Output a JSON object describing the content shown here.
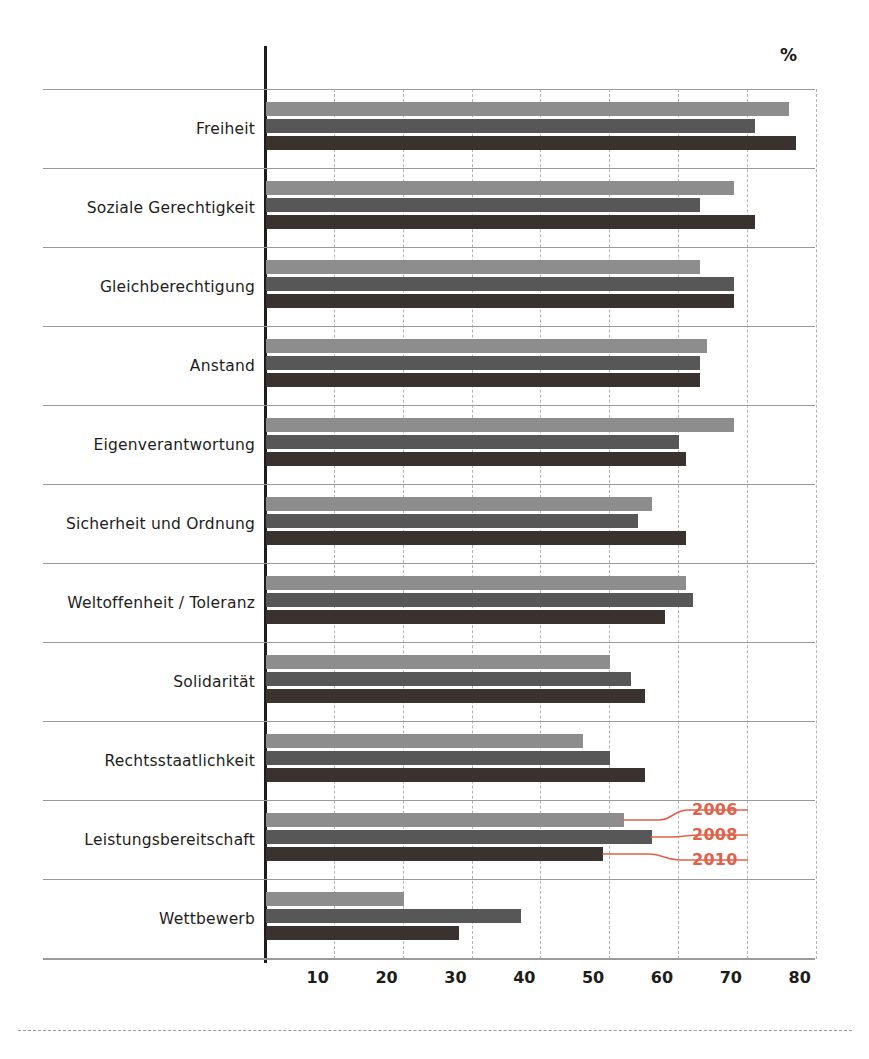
{
  "chart_data": {
    "type": "bar",
    "orientation": "horizontal",
    "title": "",
    "subtitle": "",
    "xlabel": "",
    "ylabel": "",
    "unit_label": "%",
    "xlim": [
      0,
      85
    ],
    "xticks": [
      10,
      20,
      30,
      40,
      50,
      60,
      70,
      80
    ],
    "xtick_labels": [
      "10",
      "20",
      "30",
      "40",
      "50",
      "60",
      "70",
      "80"
    ],
    "grid": "vertical-dashed",
    "legend_position": "inline-callout",
    "categories": [
      "Freiheit",
      "Soziale Gerechtigkeit",
      "Gleichberechtigung",
      "Anstand",
      "Eigenverantwortung",
      "Sicherheit und Ordnung",
      "Weltoffenheit / Toleranz",
      "Solidarität",
      "Rechtsstaatlichkeit",
      "Leistungsbereitschaft",
      "Wettbewerb"
    ],
    "series": [
      {
        "name": "2006",
        "color": "#8d8d8d",
        "values": [
          76,
          68,
          63,
          64,
          68,
          56,
          61,
          50,
          46,
          52,
          20
        ]
      },
      {
        "name": "2008",
        "color": "#575757",
        "values": [
          71,
          63,
          68,
          63,
          60,
          54,
          62,
          53,
          50,
          56,
          37
        ]
      },
      {
        "name": "2010",
        "color": "#3a322e",
        "values": [
          77,
          71,
          68,
          63,
          61,
          61,
          58,
          55,
          55,
          49,
          28
        ]
      }
    ],
    "annotations": [
      {
        "label": "2006",
        "series": "2006",
        "category": "Leistungsbereitschaft"
      },
      {
        "label": "2008",
        "series": "2008",
        "category": "Leistungsbereitschaft"
      },
      {
        "label": "2010",
        "series": "2010",
        "category": "Leistungsbereitschaft"
      }
    ],
    "colors": {
      "series_2006": "#8d8d8d",
      "series_2008": "#575757",
      "series_2010": "#3a322e",
      "annotation": "#e1604a",
      "axis": "#1d1d1b",
      "grid": "#b4b4b4",
      "rowline": "#9a9a9a",
      "background": "#ffffff"
    }
  }
}
